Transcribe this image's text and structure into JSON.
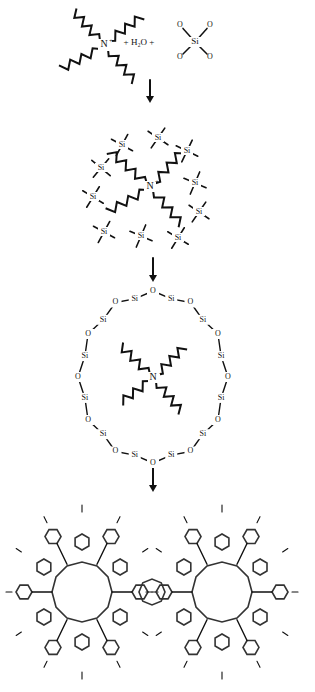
{
  "diagram": {
    "type": "synthesis-scheme",
    "stages": [
      {
        "id": "reactants",
        "labels": {
          "nitrogen": "N",
          "charge": "+",
          "plus1": "+",
          "water": "H₂O",
          "plus2": "+",
          "silicon": "Si",
          "oxygen": "O"
        }
      },
      {
        "id": "hydrated-silica-cluster",
        "si_label": "Si",
        "nitrogen": "N",
        "charge": "+"
      },
      {
        "id": "silicate-ring",
        "si_label": "Si",
        "o_label": "O",
        "nitrogen": "N",
        "charge": "+"
      },
      {
        "id": "zeolite-framework"
      }
    ],
    "arrows": [
      "reactants-to-cluster",
      "cluster-to-ring",
      "ring-to-framework"
    ]
  }
}
